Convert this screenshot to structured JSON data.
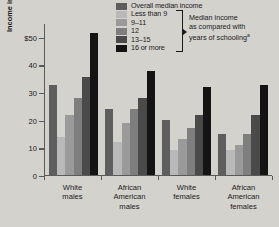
{
  "legend": {
    "items": [
      {
        "label": "Overall median income",
        "color": "#5e5e5e"
      },
      {
        "label": "Less than 9",
        "color": "#b9b9b9"
      },
      {
        "label": "9–11",
        "color": "#9a9a9a"
      },
      {
        "label": "12",
        "color": "#7e7e7e"
      },
      {
        "label": "13–15",
        "color": "#4a4a4a"
      },
      {
        "label": "16 or more",
        "color": "#141414"
      }
    ],
    "note_line1": "Median income",
    "note_line2": "as compared with",
    "note_line3": "years of schooling",
    "note_superscript": "a"
  },
  "axis": {
    "y_title": "Income in thousands of dollars",
    "y_ticks": [
      "$50",
      "40",
      "30",
      "20",
      "10",
      "0"
    ],
    "y_tick_values": [
      50,
      40,
      30,
      20,
      10,
      0
    ]
  },
  "chart_data": {
    "type": "bar",
    "title": "",
    "xlabel": "",
    "ylabel": "Income in thousands of dollars",
    "ylim": [
      0,
      55
    ],
    "grid": false,
    "legend_position": "top-right",
    "categories": [
      "White males",
      "African American males",
      "White females",
      "African American females"
    ],
    "series": [
      {
        "name": "Overall median income",
        "color": "#5e5e5e",
        "values": [
          33,
          24,
          20,
          15
        ]
      },
      {
        "name": "Less than 9",
        "color": "#b9b9b9",
        "values": [
          14,
          12,
          9,
          9
        ]
      },
      {
        "name": "9–11",
        "color": "#9a9a9a",
        "values": [
          22,
          19,
          13,
          11
        ]
      },
      {
        "name": "12",
        "color": "#7e7e7e",
        "values": [
          28,
          24,
          17,
          15
        ]
      },
      {
        "name": "13–15",
        "color": "#4a4a4a",
        "values": [
          36,
          28,
          22,
          22
        ]
      },
      {
        "name": "16 or more",
        "color": "#141414",
        "values": [
          52,
          38,
          32,
          33
        ]
      }
    ]
  }
}
